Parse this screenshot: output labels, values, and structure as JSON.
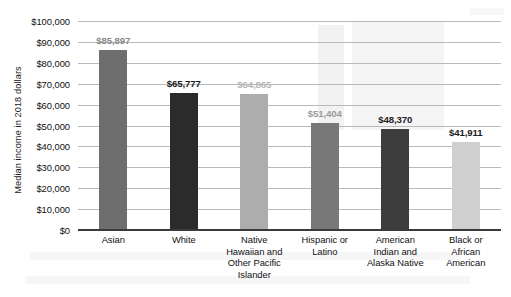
{
  "chart_data": {
    "type": "bar",
    "title": "",
    "xlabel": "",
    "ylabel": "Median income in 2018 dollars",
    "ylim": [
      0,
      100000
    ],
    "ytick_step": 10000,
    "grid": true,
    "legend": "none",
    "orientation": "vertical",
    "ytick_labels": [
      "$100,000",
      "$90,000",
      "$80,000",
      "$70,000",
      "$60,000",
      "$50,000",
      "$40,000",
      "$30,000",
      "$20,000",
      "$10,000",
      "$0"
    ],
    "ytick_values": [
      100000,
      90000,
      80000,
      70000,
      60000,
      50000,
      40000,
      30000,
      20000,
      10000,
      0
    ],
    "categories": [
      "Asian",
      "White",
      "Native Hawaiian and Other Pacific Islander",
      "Hispanic or Latino",
      "American Indian and Alaska Native",
      "Black or African American"
    ],
    "category_lines": [
      [
        "Asian"
      ],
      [
        "White"
      ],
      [
        "Native",
        "Hawaiian and",
        "Other Pacific",
        "Islander"
      ],
      [
        "Hispanic or",
        "Latino"
      ],
      [
        "American",
        "Indian and",
        "Alaska Native"
      ],
      [
        "Black or",
        "African",
        "American"
      ]
    ],
    "values": [
      85897,
      65777,
      64865,
      51404,
      48370,
      41911
    ],
    "data_labels": [
      "$85,897",
      "$65,777",
      "$64,865",
      "$51,404",
      "$48,370",
      "$41,911"
    ],
    "bar_colors": [
      "#6e6e6e",
      "#2b2b2b",
      "#adadad",
      "#787878",
      "#3d3d3d",
      "#cfcfcf"
    ],
    "label_colors": [
      "#8a8a8a",
      "#1a1a1a",
      "#b5b5b5",
      "#9a9a9a",
      "#222222",
      "#1a1a1a"
    ]
  },
  "axis": {
    "gridline_color": "#b9b9b9",
    "axis_color": "#3a3a3a"
  }
}
